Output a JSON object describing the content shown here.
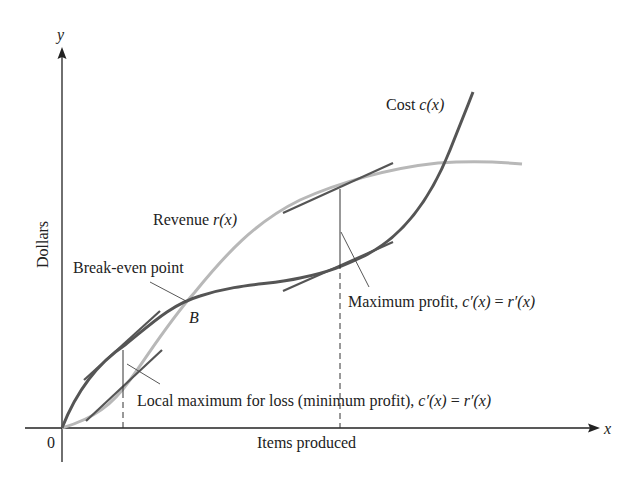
{
  "diagram": {
    "axes": {
      "x_label": "x",
      "y_label": "y",
      "origin_label": "0",
      "x_title": "Items produced",
      "y_title": "Dollars"
    },
    "curves": {
      "cost": {
        "name": "Cost",
        "func": "c(x)",
        "color": "#555555"
      },
      "revenue": {
        "name": "Revenue",
        "func": "r(x)",
        "color": "#b5b5b5"
      }
    },
    "annotations": {
      "break_even": "Break-even point",
      "break_even_point": "B",
      "max_profit_prefix": "Maximum profit, ",
      "min_profit_prefix": "Local maximum for loss (minimum profit), ",
      "condition_lhs": "c′(x)",
      "condition_eq": " = ",
      "condition_rhs": "r′(x)"
    }
  }
}
